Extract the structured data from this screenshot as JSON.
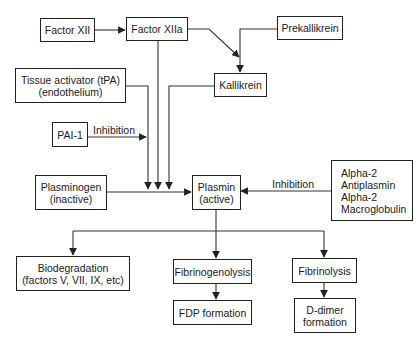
{
  "diagram": {
    "nodes": {
      "factor_xii": {
        "lines": [
          "Factor XII"
        ]
      },
      "factor_xiia": {
        "lines": [
          "Factor XIIa"
        ]
      },
      "prekallikrein": {
        "lines": [
          "Prekallikrein"
        ]
      },
      "kallikrein": {
        "lines": [
          "Kallikrein"
        ]
      },
      "tpa": {
        "lines": [
          "Tissue activator (tPA)",
          "(endothelium)"
        ]
      },
      "pai1": {
        "lines": [
          "PAI-1"
        ]
      },
      "plasminogen": {
        "lines": [
          "Plasminogen",
          "(inactive)"
        ]
      },
      "plasmin": {
        "lines": [
          "Plasmin",
          "(active)"
        ]
      },
      "alpha2": {
        "lines": [
          "Alpha-2",
          "Antiplasmin",
          "Alpha-2",
          "Macroglobulin"
        ]
      },
      "biodegradation": {
        "lines": [
          "Biodegradation",
          "(factors V, VII, IX, etc)"
        ]
      },
      "fibrinogenolysis": {
        "lines": [
          "Fibrinogenolysis"
        ]
      },
      "fibrinolysis": {
        "lines": [
          "Fibrinolysis"
        ]
      },
      "fdp": {
        "lines": [
          "FDP formation"
        ]
      },
      "ddimer": {
        "lines": [
          "D-dimer",
          "formation"
        ]
      }
    },
    "edge_labels": {
      "pai1_inhibition": "Inhibition",
      "alpha2_inhibition": "Inhibition"
    },
    "edges": [
      {
        "from": "Factor XII",
        "to": "Factor XIIa"
      },
      {
        "from": "Factor XIIa",
        "to": "Kallikrein"
      },
      {
        "from": "Prekallikrein",
        "to": "Kallikrein"
      },
      {
        "from": "Factor XIIa",
        "to": "Plasmin"
      },
      {
        "from": "Kallikrein",
        "to": "Plasmin"
      },
      {
        "from": "Tissue activator (tPA)",
        "to": "Plasmin"
      },
      {
        "from": "PAI-1",
        "to": "Tissue activator path",
        "label": "Inhibition"
      },
      {
        "from": "Plasminogen",
        "to": "Plasmin"
      },
      {
        "from": "Alpha-2 Antiplasmin / Alpha-2 Macroglobulin",
        "to": "Plasmin",
        "label": "Inhibition"
      },
      {
        "from": "Plasmin",
        "to": "Biodegradation"
      },
      {
        "from": "Plasmin",
        "to": "Fibrinogenolysis"
      },
      {
        "from": "Plasmin",
        "to": "Fibrinolysis"
      },
      {
        "from": "Fibrinogenolysis",
        "to": "FDP formation"
      },
      {
        "from": "Fibrinolysis",
        "to": "D-dimer formation"
      }
    ],
    "colors": {
      "line": "#333333",
      "border": "#222222",
      "text": "#1a1a1a",
      "background": "#ffffff"
    }
  }
}
